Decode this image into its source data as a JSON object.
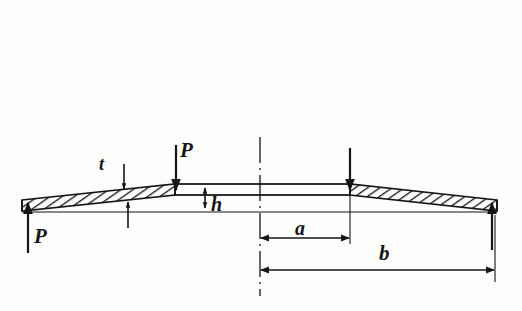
{
  "figure": {
    "background_color": "#fdfdfc",
    "line_color": "#151515",
    "hatch_color": "#151515",
    "symmetry": "vertical centerline, left-right mirrored",
    "centerline_x": 260
  },
  "labels": {
    "load_left": "P",
    "load_top": "P",
    "thickness": "t",
    "cone_height": "h",
    "inner_radius": "a",
    "outer_radius": "b"
  },
  "geometry": {
    "outer_edge_left_x": 22,
    "outer_edge_right_x": 497,
    "inner_edge_left_x": 175,
    "inner_edge_right_x": 350,
    "baseline_y": 212,
    "flat_top_y": 184,
    "flat_bottom_y": 195,
    "outer_top_y": 200,
    "outer_bottom_y": 211
  },
  "dimensions": {
    "a": {
      "from_x": 260,
      "to_x": 350,
      "y": 232
    },
    "b": {
      "from_x": 260,
      "to_x": 495,
      "y": 270
    },
    "h": {
      "x": 205,
      "from_y": 186,
      "to_y": 209
    },
    "t": {
      "x": 124,
      "from_y": 168,
      "to_y": 225
    }
  },
  "forces": [
    {
      "name": "P-left-up",
      "x": 28,
      "label": "P",
      "direction": "up"
    },
    {
      "name": "P-top-left",
      "x": 176,
      "label": "P",
      "direction": "down"
    },
    {
      "name": "force-top-right",
      "x": 350,
      "label": "",
      "direction": "down"
    },
    {
      "name": "force-right-up",
      "x": 492,
      "label": "",
      "direction": "up"
    }
  ]
}
